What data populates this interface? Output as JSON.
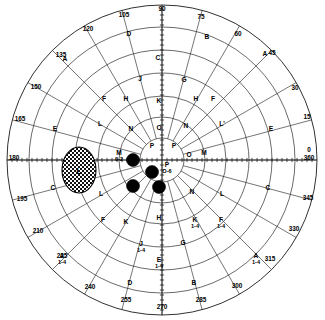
{
  "chart_data": {
    "type": "scatter",
    "subtitle": "",
    "projection": "polar",
    "grid": true,
    "legend_position": "none",
    "center": {
      "x": 162,
      "y": 160
    },
    "radial_axis": {
      "label": "eccentricity (degrees)",
      "rings_px": [
        22,
        43,
        64,
        87,
        110,
        133,
        155
      ],
      "outer_radius_px": 155
    },
    "angular_axis": {
      "label": "meridian (degrees)",
      "tick_step": 15,
      "tick_labels": [
        "0",
        "360",
        "15",
        "30",
        "45",
        "60",
        "75",
        "90",
        "105",
        "120",
        "135",
        "150",
        "165",
        "180",
        "195",
        "210",
        "225",
        "240",
        "255",
        "270",
        "285",
        "300",
        "315",
        "330",
        "345"
      ]
    },
    "degree_marks": [
      {
        "deg": 0,
        "label": "0",
        "x": 309,
        "y": 152
      },
      {
        "deg": 0,
        "label": "360",
        "x": 309,
        "y": 160
      },
      {
        "deg": 15,
        "label": "15",
        "x": 307,
        "y": 119
      },
      {
        "deg": 30,
        "label": "30",
        "x": 295,
        "y": 90
      },
      {
        "deg": 45,
        "label": "45",
        "x": 272,
        "y": 55
      },
      {
        "deg": 60,
        "label": "60",
        "x": 238,
        "y": 36
      },
      {
        "deg": 75,
        "label": "75",
        "x": 201,
        "y": 19
      },
      {
        "deg": 90,
        "label": "90",
        "x": 162,
        "y": 11
      },
      {
        "deg": 105,
        "label": "105",
        "x": 124,
        "y": 17
      },
      {
        "deg": 120,
        "label": "120",
        "x": 88,
        "y": 31
      },
      {
        "deg": 135,
        "label": "135",
        "x": 61,
        "y": 57
      },
      {
        "deg": 150,
        "label": "150",
        "x": 36,
        "y": 89
      },
      {
        "deg": 165,
        "label": "165",
        "x": 20,
        "y": 121
      },
      {
        "deg": 180,
        "label": "180",
        "x": 14,
        "y": 160
      },
      {
        "deg": 195,
        "label": "195",
        "x": 22,
        "y": 201
      },
      {
        "deg": 210,
        "label": "210",
        "x": 38,
        "y": 233
      },
      {
        "deg": 225,
        "label": "225",
        "x": 62,
        "y": 258
      },
      {
        "deg": 240,
        "label": "240",
        "x": 90,
        "y": 289
      },
      {
        "deg": 255,
        "label": "255",
        "x": 126,
        "y": 302
      },
      {
        "deg": 270,
        "label": "270",
        "x": 162,
        "y": 309
      },
      {
        "deg": 285,
        "label": "285",
        "x": 201,
        "y": 302
      },
      {
        "deg": 300,
        "label": "300",
        "x": 237,
        "y": 288
      },
      {
        "deg": 315,
        "label": "315",
        "x": 270,
        "y": 261
      },
      {
        "deg": 330,
        "label": "330",
        "x": 294,
        "y": 231
      },
      {
        "deg": 345,
        "label": "345",
        "x": 308,
        "y": 200
      }
    ],
    "isopter_labels": [
      {
        "id": "A-45",
        "text": "A",
        "x": 265,
        "y": 56,
        "sub": ""
      },
      {
        "id": "B-ur",
        "text": "B",
        "x": 207,
        "y": 39,
        "sub": ""
      },
      {
        "id": "D-ul",
        "text": "D",
        "x": 129,
        "y": 36,
        "sub": ""
      },
      {
        "id": "A-135",
        "text": "A",
        "x": 65,
        "y": 61,
        "sub": ""
      },
      {
        "id": "E-ur",
        "text": "E",
        "x": 271,
        "y": 131,
        "sub": ""
      },
      {
        "id": "F-ur",
        "text": "F",
        "x": 213,
        "y": 101,
        "sub": ""
      },
      {
        "id": "G-ur",
        "text": "G",
        "x": 184,
        "y": 82,
        "sub": ""
      },
      {
        "id": "H-ur",
        "text": "H",
        "x": 196,
        "y": 101,
        "sub": ""
      },
      {
        "id": "L-ur",
        "text": "L'",
        "x": 222,
        "y": 126,
        "sub": ""
      },
      {
        "id": "N-ur",
        "text": "N",
        "x": 186,
        "y": 128,
        "sub": ""
      },
      {
        "id": "P-ur",
        "text": "P",
        "x": 174,
        "y": 148,
        "sub": ""
      },
      {
        "id": "C-90",
        "text": "C",
        "x": 158,
        "y": 60,
        "sub": ""
      },
      {
        "id": "J-ul",
        "text": "J",
        "x": 140,
        "y": 81,
        "sub": ""
      },
      {
        "id": "K-90",
        "text": "K",
        "x": 159,
        "y": 103,
        "sub": ""
      },
      {
        "id": "O-90",
        "text": "O",
        "x": 159,
        "y": 130,
        "sub": ""
      },
      {
        "id": "P-ul",
        "text": "P",
        "x": 152,
        "y": 148,
        "sub": ""
      },
      {
        "id": "H-ul",
        "text": "H",
        "x": 126,
        "y": 101,
        "sub": ""
      },
      {
        "id": "F-ul",
        "text": "F",
        "x": 104,
        "y": 101,
        "sub": ""
      },
      {
        "id": "L-ul",
        "text": "L",
        "x": 100,
        "y": 126,
        "sub": ""
      },
      {
        "id": "N-ul",
        "text": "N",
        "x": 131,
        "y": 131,
        "sub": ""
      },
      {
        "id": "E-ul",
        "text": "E",
        "x": 55,
        "y": 131,
        "sub": ""
      },
      {
        "id": "C-ll",
        "text": "C",
        "x": 53,
        "y": 190,
        "sub": ""
      },
      {
        "id": "L-ll",
        "text": "L",
        "x": 101,
        "y": 196,
        "sub": ""
      },
      {
        "id": "F-ll",
        "text": "F",
        "x": 103,
        "y": 222,
        "sub": ""
      },
      {
        "id": "K-ll",
        "text": "K",
        "x": 126,
        "y": 224,
        "sub": ""
      },
      {
        "id": "J-ll",
        "text": "J",
        "x": 141,
        "y": 246,
        "sub": "1-4"
      },
      {
        "id": "A-225",
        "text": "A",
        "x": 62,
        "y": 258,
        "sub": "1-4"
      },
      {
        "id": "D-ll",
        "text": "D",
        "x": 130,
        "y": 285,
        "sub": ""
      },
      {
        "id": "H-270",
        "text": "H",
        "x": 159,
        "y": 220,
        "sub": ""
      },
      {
        "id": "E-270",
        "text": "E",
        "x": 159,
        "y": 262,
        "sub": "1-4"
      },
      {
        "id": "N-lr",
        "text": "N",
        "x": 192,
        "y": 194,
        "sub": ""
      },
      {
        "id": "L-lr",
        "text": "L",
        "x": 222,
        "y": 196,
        "sub": ""
      },
      {
        "id": "C-lr",
        "text": "C",
        "x": 268,
        "y": 190,
        "sub": ""
      },
      {
        "id": "K-lr",
        "text": "K",
        "x": 195,
        "y": 222,
        "sub": "1-4"
      },
      {
        "id": "F-lr",
        "text": "F",
        "x": 221,
        "y": 222,
        "sub": "1-4"
      },
      {
        "id": "G-lr",
        "text": "G",
        "x": 183,
        "y": 245,
        "sub": ""
      },
      {
        "id": "B-lr",
        "text": "B",
        "x": 194,
        "y": 285,
        "sub": ""
      },
      {
        "id": "A-315",
        "text": "A",
        "x": 256,
        "y": 258,
        "sub": "1-4"
      },
      {
        "id": "P-cr",
        "text": "P",
        "x": 167,
        "y": 167,
        "sub": "O-6"
      },
      {
        "id": "M-left",
        "text": "M",
        "x": 119,
        "y": 155,
        "sub": "0-2"
      },
      {
        "id": "O-right",
        "text": "O",
        "x": 189,
        "y": 157,
        "sub": ""
      },
      {
        "id": "M-right",
        "text": "M",
        "x": 204,
        "y": 155,
        "sub": ""
      }
    ],
    "blind_spot": {
      "label": "L",
      "cx": 79,
      "cy": 170,
      "rx": 17,
      "ry": 23,
      "fill_pattern": "checkerboard"
    },
    "scotoma_points": [
      {
        "x": 133,
        "y": 160,
        "r": 6.5
      },
      {
        "x": 152,
        "y": 172,
        "r": 6.5
      },
      {
        "x": 133,
        "y": 186,
        "r": 6.5
      },
      {
        "x": 159,
        "y": 187,
        "r": 6.5
      }
    ],
    "colors": {
      "background": "#ffffff",
      "grid": "#1a1a1a",
      "marker": "#000000",
      "text": "#000000"
    }
  }
}
